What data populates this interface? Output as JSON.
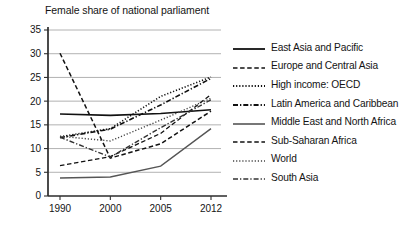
{
  "chart_data": {
    "type": "line",
    "title": "Female share of national parliament",
    "xlabel": "",
    "ylabel": "",
    "x": [
      "1990",
      "2000",
      "2005",
      "2012"
    ],
    "xtick_labels": [
      "1990",
      "2000",
      "2005",
      "2012"
    ],
    "ytick_labels": [
      "0",
      "5",
      "10",
      "15",
      "20",
      "25",
      "30",
      "35"
    ],
    "ylim": [
      0,
      35
    ],
    "ytick_step": 5,
    "grid": "horizontal",
    "legend_position": "right",
    "series": [
      {
        "name": "East Asia and Pacific",
        "values": [
          17.3,
          17.0,
          17.4,
          18.2
        ],
        "style": "solid",
        "color": "#111111",
        "width": 1.6
      },
      {
        "name": "Europe and Central Asia",
        "values": [
          30.1,
          8.0,
          11.0,
          17.9
        ],
        "style": "dashed",
        "color": "#111111",
        "width": 1.5
      },
      {
        "name": "High income: OECD",
        "values": [
          12.5,
          14.2,
          21.0,
          25.1
        ],
        "style": "dotted",
        "color": "#111111",
        "width": 1.6
      },
      {
        "name": "Latin America and Caribbean",
        "values": [
          12.3,
          14.1,
          19.2,
          24.8
        ],
        "style": "dashdot",
        "color": "#111111",
        "width": 1.6
      },
      {
        "name": "Middle East and North Africa",
        "values": [
          3.8,
          4.0,
          6.3,
          14.2
        ],
        "style": "solid",
        "color": "#555555",
        "width": 1.4
      },
      {
        "name": "Sub-Saharan Africa",
        "values": [
          6.4,
          8.3,
          13.2,
          21.4
        ],
        "style": "dashed",
        "color": "#111111",
        "width": 1.3
      },
      {
        "name": "World",
        "values": [
          12.6,
          11.6,
          16.0,
          20.6
        ],
        "style": "dotted",
        "color": "#444444",
        "width": 1.4
      },
      {
        "name": "South Asia",
        "values": [
          12.4,
          8.2,
          14.4,
          20.3
        ],
        "style": "dashdot",
        "color": "#333333",
        "width": 1.4
      }
    ]
  }
}
